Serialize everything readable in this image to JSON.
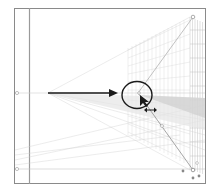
{
  "screen": {
    "title": "Perspective grid — dragging horizon/vanishing point widget",
    "frame_color": "#8a8a8a",
    "grid_color": "#c8c8c8",
    "annotation_color": "#1a1a1a"
  },
  "annotations": {
    "arrow_label": "arrow pointing to widget",
    "circle_label": "highlighted vanishing point widget",
    "cursor_label": "pointer cursor with horizontal double-arrow"
  },
  "widgets": {
    "left_ground_handle": "left-ground-level-handle",
    "horizon_handle": "horizon-line-handle",
    "vanishing_point": "vanishing-point-handle",
    "right_top_handle": "grid-extent-handle",
    "right_bottom_handle": "ground-origin-handle"
  }
}
